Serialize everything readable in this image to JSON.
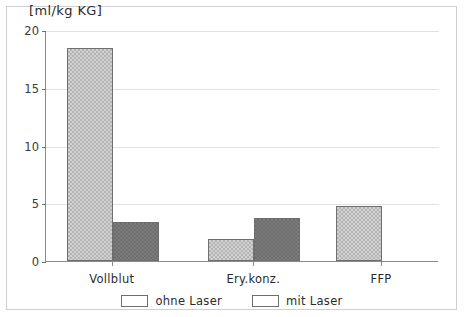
{
  "chart_data": {
    "type": "bar",
    "title": "[ml/kg KG]",
    "xlabel": "",
    "ylabel": "[ml/kg KG]",
    "ylim": [
      0,
      20
    ],
    "yticks": [
      0,
      5,
      10,
      15,
      20
    ],
    "ytick_labels": [
      "0",
      "5",
      "10",
      "15",
      "20"
    ],
    "grid": true,
    "legend_position": "bottom-center",
    "categories": [
      "Vollblut",
      "Ery.konz.",
      "FFP"
    ],
    "series": [
      {
        "name": "ohne Laser",
        "color": "#d2d2d2",
        "pattern": "light-hatch",
        "values": [
          18.4,
          1.9,
          4.8
        ]
      },
      {
        "name": "mit Laser",
        "color": "#7b7b7b",
        "pattern": "dark-hatch",
        "values": [
          3.4,
          3.7,
          0
        ]
      }
    ]
  },
  "legend": {
    "entries": [
      {
        "label": "ohne Laser"
      },
      {
        "label": "mit Laser"
      }
    ]
  }
}
